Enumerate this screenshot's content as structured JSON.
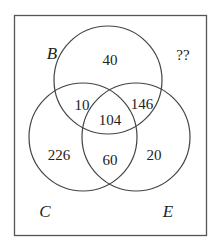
{
  "diagram": {
    "type": "venn-3",
    "universe_label": "??",
    "sets": [
      {
        "name": "B",
        "label": "B"
      },
      {
        "name": "C",
        "label": "C"
      },
      {
        "name": "E",
        "label": "E"
      }
    ],
    "regions": {
      "B_only": "40",
      "C_only": "226",
      "E_only": "20",
      "B_and_C_only": "10",
      "B_and_E_only": "146",
      "C_and_E_only": "60",
      "B_and_C_and_E": "104",
      "outside": "??"
    },
    "colors": {
      "stroke": "#444444",
      "text": "#222222",
      "background": "#ffffff"
    }
  }
}
